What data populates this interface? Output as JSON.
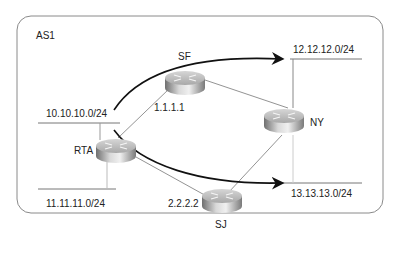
{
  "diagram": {
    "as_label": "AS1",
    "colors": {
      "boundary": "#8a8a8a",
      "link": "#777777",
      "arrow": "#111111",
      "text": "#222222",
      "router_top": "#c8c8c8",
      "router_side_dark": "#6f6f6f",
      "router_side_light": "#e6e6e6"
    },
    "routers": [
      {
        "id": "RTA",
        "name": "RTA",
        "ip": ""
      },
      {
        "id": "SF",
        "name": "SF",
        "ip": "1.1.1.1"
      },
      {
        "id": "NY",
        "name": "NY",
        "ip": ""
      },
      {
        "id": "SJ",
        "name": "SJ",
        "ip": "2.2.2.2"
      }
    ],
    "networks": [
      {
        "id": "net10",
        "prefix": "10.10.10.0/24",
        "attached_to": "RTA"
      },
      {
        "id": "net11",
        "prefix": "11.11.11.0/24",
        "attached_to": "RTA"
      },
      {
        "id": "net12",
        "prefix": "12.12.12.0/24",
        "attached_to": "NY"
      },
      {
        "id": "net13",
        "prefix": "13.13.13.0/24",
        "attached_to": "NY"
      }
    ],
    "links": [
      {
        "from": "RTA",
        "to": "SF"
      },
      {
        "from": "RTA",
        "to": "SJ"
      },
      {
        "from": "SF",
        "to": "NY"
      },
      {
        "from": "SJ",
        "to": "NY"
      }
    ],
    "traffic_arrows": [
      {
        "from": "10.10.10.0/24",
        "to": "12.12.12.0/24",
        "via": "SF"
      },
      {
        "from": "RTA",
        "to": "13.13.13.0/24",
        "via": "SJ"
      }
    ]
  }
}
